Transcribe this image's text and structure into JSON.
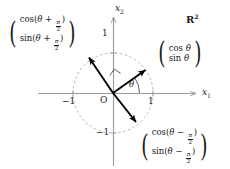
{
  "figure": {
    "space_label": "R",
    "space_exponent": "2",
    "axes": {
      "x_axis_label": "x",
      "x_axis_subscript": "1",
      "y_axis_label": "x",
      "y_axis_subscript": "2"
    },
    "origin_label": "O",
    "angle_label": "θ",
    "ticks": {
      "x_positive": "1",
      "x_negative": "−1",
      "y_positive": "1",
      "y_negative": "−1"
    },
    "vectors": [
      {
        "id": "vector-theta",
        "row1_prefix": "cos ",
        "row1_arg": "θ",
        "row2_prefix": "sin ",
        "row2_arg": "θ",
        "has_fraction": false,
        "angle_deg": 35
      },
      {
        "id": "vector-theta-plus-half-pi",
        "row1_prefix": "cos(",
        "row1_arg": "θ",
        "row1_op": " + ",
        "row1_suffix": ")",
        "row2_prefix": "sin(",
        "row2_arg": "θ",
        "row2_op": " + ",
        "row2_suffix": ")",
        "fraction_num": "π",
        "fraction_den": "2",
        "has_fraction": true,
        "angle_deg": 125
      },
      {
        "id": "vector-theta-minus-half-pi",
        "row1_prefix": "cos(",
        "row1_arg": "θ",
        "row1_op": " − ",
        "row1_suffix": ")",
        "row2_prefix": "sin(",
        "row2_arg": "θ",
        "row2_op": " − ",
        "row2_suffix": ")",
        "fraction_num": "π",
        "fraction_den": "2",
        "has_fraction": true,
        "angle_deg": -55
      }
    ],
    "colors": {
      "axis": "#9a9a9a",
      "circle": "#b0b0b0",
      "vector": "#000000",
      "text": "#1a1a1a",
      "background": "#ffffff"
    },
    "geometry": {
      "origin_x": 113,
      "origin_y": 93,
      "radius": 40
    }
  }
}
